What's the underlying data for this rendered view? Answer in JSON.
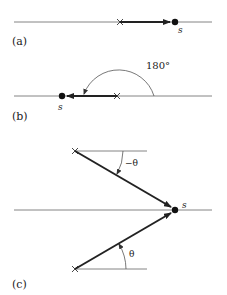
{
  "panels": [
    {
      "id": "a",
      "label": "(a)",
      "point_label": "s",
      "description": "vector from cross to point s pointing right (0°)"
    },
    {
      "id": "b",
      "label": "(b)",
      "point_label": "s",
      "angle_label": "180°",
      "description": "vector from cross to point s pointing left, 180° arc"
    },
    {
      "id": "c",
      "label": "(c)",
      "point_label": "s",
      "angle_upper_label": "−θ",
      "angle_lower_label": "θ",
      "description": "two vectors converging on s from upper and lower crosses"
    }
  ],
  "colors": {
    "line": "#555555",
    "vector": "#222222",
    "text": "#222222"
  }
}
